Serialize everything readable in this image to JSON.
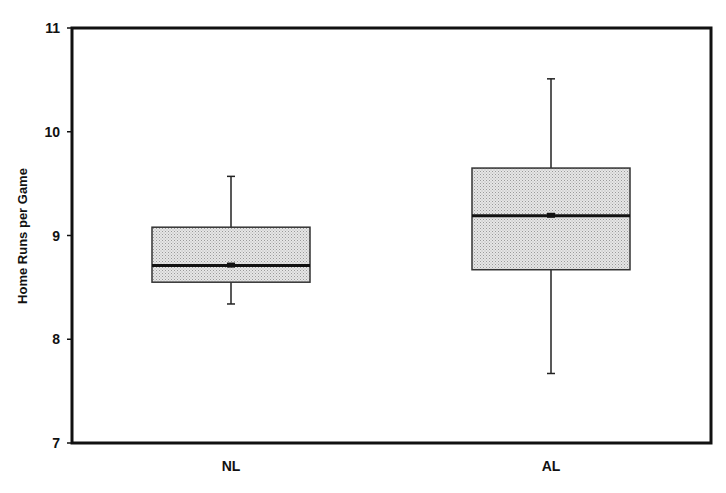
{
  "chart_data": {
    "type": "box",
    "title": "",
    "xlabel": "",
    "ylabel": "Home Runs per Game",
    "ylim": [
      7,
      11
    ],
    "yticks": [
      7,
      8,
      9,
      10,
      11
    ],
    "grid": false,
    "legend": null,
    "categories": [
      "NL",
      "AL"
    ],
    "series": [
      {
        "name": "NL",
        "whisker_low": 8.34,
        "q1": 8.55,
        "median": 8.71,
        "q3": 9.08,
        "whisker_high": 9.57
      },
      {
        "name": "AL",
        "whisker_low": 7.67,
        "q1": 8.67,
        "median": 9.19,
        "q3": 9.65,
        "whisker_high": 10.51
      }
    ],
    "colors": {
      "box_fill": "#d4d4d4",
      "stroke": "#111111"
    }
  }
}
